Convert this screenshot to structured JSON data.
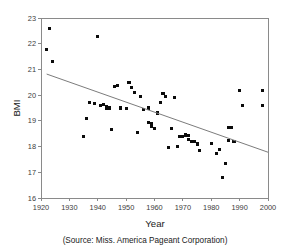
{
  "chart_data": {
    "type": "scatter",
    "title": "",
    "xlabel": "Year",
    "ylabel": "BMI",
    "caption": "(Source: Miss. America Pageant Corporation)",
    "xlim": [
      1920,
      2000
    ],
    "ylim": [
      16,
      23
    ],
    "xticks": [
      1920,
      1930,
      1940,
      1950,
      1960,
      1970,
      1980,
      1990,
      2000
    ],
    "yticks": [
      16,
      17,
      18,
      19,
      20,
      21,
      22,
      23
    ],
    "xtick_labels": [
      "1920",
      "1930",
      "1940",
      "1950",
      "1960",
      "1970",
      "1980",
      "1990",
      "2000"
    ],
    "ytick_labels": [
      "16",
      "17",
      "18",
      "19",
      "20",
      "21",
      "22",
      "23"
    ],
    "grid": false,
    "legend": false,
    "marker": "square",
    "marker_color": "#0b0b0b",
    "frame_color": "#8a8a8a",
    "trendline": {
      "show": true,
      "color": "#7c7c7c",
      "x0": 1922,
      "y0": 20.82,
      "x1": 2000,
      "y1": 17.78
    },
    "x": [
      1922,
      1923,
      1924,
      1935,
      1936,
      1937,
      1939,
      1940,
      1941,
      1942,
      1943,
      1943,
      1944,
      1944,
      1945,
      1946,
      1947,
      1948,
      1950,
      1951,
      1952,
      1953,
      1954,
      1955,
      1956,
      1958,
      1958,
      1959,
      1959,
      1960,
      1960,
      1961,
      1961,
      1962,
      1963,
      1964,
      1965,
      1966,
      1967,
      1968,
      1969,
      1970,
      1971,
      1972,
      1972,
      1973,
      1974,
      1975,
      1976,
      1980,
      1982,
      1983,
      1984,
      1985,
      1986,
      1986,
      1987,
      1988,
      1990,
      1991,
      1998,
      1998
    ],
    "y": [
      21.78,
      22.58,
      21.3,
      18.4,
      19.08,
      19.72,
      19.66,
      22.28,
      19.6,
      19.62,
      19.55,
      19.5,
      19.52,
      19.48,
      18.68,
      20.34,
      20.36,
      19.5,
      19.48,
      20.5,
      20.28,
      20.12,
      18.56,
      19.96,
      19.45,
      19.5,
      18.95,
      18.88,
      18.8,
      18.72,
      18.7,
      19.32,
      19.3,
      19.7,
      20.05,
      19.95,
      17.98,
      18.7,
      19.92,
      18.0,
      18.4,
      18.38,
      18.45,
      18.42,
      18.28,
      18.2,
      18.18,
      18.1,
      17.85,
      18.12,
      17.72,
      17.9,
      16.8,
      17.35,
      18.22,
      18.75,
      18.75,
      18.18,
      20.18,
      19.6,
      20.18,
      19.6
    ]
  },
  "figure": {
    "y_axis_title": "BMI",
    "x_axis_title": "Year",
    "source_caption": "(Source: Miss. America Pageant Corporation)"
  }
}
